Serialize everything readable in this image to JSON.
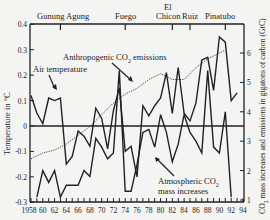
{
  "chart_data": {
    "type": "line",
    "title": "",
    "xlabel": "Year",
    "ylabel": "Temperature in °C",
    "ylabel_right": "CO2 mass increases and emissions in gigatons of carbon (GtC)",
    "xlim": [
      1958,
      1994
    ],
    "ylim": [
      -0.3,
      0.4
    ],
    "ylim_right": [
      1,
      7
    ],
    "x_tick_labels": [
      "1958",
      "60",
      "62",
      "64",
      "66",
      "68",
      "70",
      "72",
      "74",
      "76",
      "78",
      "80",
      "82",
      "84",
      "86",
      "88",
      "90",
      "92",
      "94"
    ],
    "y_tick_labels": [
      "0.4",
      "0.3",
      "0.2",
      "0.1",
      "0",
      "-0.1",
      "-0.2",
      "-0.3"
    ],
    "y_right_tick_labels": [
      "6",
      "5",
      "4",
      "3",
      "2",
      "1"
    ],
    "volcanoes": [
      {
        "name": "Gunung Agung",
        "year": 1963
      },
      {
        "name": "Fuego",
        "year": 1974
      },
      {
        "name": "El Chicon",
        "year": 1982
      },
      {
        "name": "Ruiz",
        "year": 1985
      },
      {
        "name": "Pinatubo",
        "year": 1991
      }
    ],
    "annotations": [
      "Air temperature",
      "Anthropogenic CO2 emissions",
      "Atmospheric CO2 mass increases"
    ],
    "grid": false,
    "series": [
      {
        "name": "Air temperature",
        "axis": "left",
        "style": "solid",
        "x": [
          1958,
          1959,
          1960,
          1961,
          1962,
          1963,
          1964,
          1965,
          1966,
          1967,
          1968,
          1969,
          1970,
          1971,
          1972,
          1973,
          1974,
          1975,
          1976,
          1977,
          1978,
          1979,
          1980,
          1981,
          1982,
          1983,
          1984,
          1985,
          1986,
          1987,
          1988,
          1989,
          1990,
          1991,
          1992,
          1993
        ],
        "values": [
          0.12,
          0.05,
          0.01,
          0.11,
          0.1,
          0.11,
          -0.15,
          -0.12,
          -0.02,
          -0.04,
          -0.08,
          0.07,
          0.03,
          -0.09,
          0.06,
          0.15,
          -0.1,
          -0.08,
          -0.2,
          0.08,
          0.04,
          0.08,
          0.11,
          0.21,
          0.05,
          0.23,
          0.05,
          0.02,
          0.09,
          0.26,
          0.27,
          0.14,
          0.35,
          0.33,
          0.1,
          0.13
        ]
      },
      {
        "name": "Anthropogenic CO2 emissions",
        "axis": "right",
        "style": "dotted",
        "x": [
          1958,
          1960,
          1962,
          1964,
          1966,
          1968,
          1970,
          1972,
          1974,
          1976,
          1978,
          1980,
          1982,
          1984,
          1986,
          1988,
          1990,
          1991
        ],
        "values": [
          2.4,
          2.6,
          2.7,
          2.9,
          3.2,
          3.5,
          3.9,
          4.3,
          4.6,
          4.8,
          5.1,
          5.3,
          5.1,
          5.1,
          5.5,
          5.8,
          6.0,
          6.1
        ]
      },
      {
        "name": "Atmospheric CO2 mass increases",
        "axis": "right",
        "style": "solid",
        "x": [
          1959,
          1960,
          1961,
          1962,
          1963,
          1964,
          1965,
          1966,
          1967,
          1968,
          1969,
          1970,
          1971,
          1972,
          1973,
          1974,
          1975,
          1976,
          1977,
          1978,
          1979,
          1980,
          1981,
          1982,
          1983,
          1984,
          1985,
          1986,
          1987,
          1988,
          1989,
          1990,
          1991,
          1992
        ],
        "values": [
          1.1,
          2.0,
          1.6,
          2.0,
          1.1,
          1.5,
          1.5,
          1.5,
          2.0,
          1.8,
          3.1,
          2.8,
          2.4,
          2.6,
          5.4,
          1.3,
          1.3,
          2.2,
          3.3,
          3.4,
          2.8,
          3.9,
          3.3,
          2.3,
          2.9,
          3.9,
          3.3,
          3.0,
          2.6,
          5.4,
          2.8,
          2.6,
          4.0,
          1.1
        ]
      }
    ]
  },
  "labels": {
    "volcano_1": "Gunung Agung",
    "volcano_2": "Fuego",
    "volcano_3a": "El",
    "volcano_3b": "Chicon",
    "volcano_4": "Ruiz",
    "volcano_5": "Pinatubo",
    "air_temp": "Air temperature",
    "emissions_a": "Anthropogenic CO",
    "emissions_sub": "2",
    "emissions_b": " emissions",
    "mass_a": "Atmospheric CO",
    "mass_sub": "2",
    "mass_b": "mass increases",
    "ylabel_left": "Temperature in °C",
    "ylabel_right_a": "CO",
    "ylabel_right_sub": "2",
    "ylabel_right_b": " mass increases and emissions in gigatons of carbon (GtC)",
    "xlabel": "Year"
  }
}
